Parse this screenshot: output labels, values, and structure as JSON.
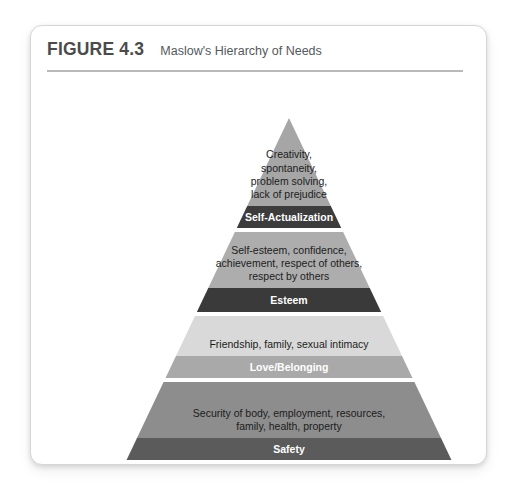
{
  "figure": {
    "number": "FIGURE 4.3",
    "title": "Maslow's Hierarchy of Needs"
  },
  "chart_data": {
    "type": "pyramid",
    "title": "Maslow's Hierarchy of Needs",
    "orientation": "apex-top",
    "level_count": 5,
    "levels": [
      {
        "rank": 5,
        "label": "Self-Actualization",
        "description": "Creativity, spontaneity, problem solving, lack of prejudice",
        "description_lines": [
          "Creativity,",
          "spontaneity,",
          "problem solving,",
          "lack of prejudice"
        ],
        "body_color": "#a6a6a6",
        "band_color": "#3c3c3c"
      },
      {
        "rank": 4,
        "label": "Esteem",
        "description": "Self-esteem, confidence, achievement, respect of others, respect by others",
        "description_lines": [
          "Self-esteem, confidence,",
          "achievement, respect of others,",
          "respect by others"
        ],
        "body_color": "#adadad",
        "band_color": "#3a3a3a"
      },
      {
        "rank": 3,
        "label": "Love/Belonging",
        "description": "Friendship, family, sexual intimacy",
        "description_lines": [
          "Friendship, family, sexual intimacy"
        ],
        "body_color": "#d9d9d9",
        "band_color": "#a9a9a9"
      },
      {
        "rank": 2,
        "label": "Safety",
        "description": "Security of body, employment, resources, family, health, property",
        "description_lines": [
          "Security of body, employment, resources,",
          "family, health, property"
        ],
        "body_color": "#8d8d8d",
        "band_color": "#5b5b5b"
      },
      {
        "rank": 1,
        "label": "Physiological",
        "description": "Breathing, food, water, sleep",
        "description_lines": [
          "Breathing, food, water, sleep"
        ],
        "body_color": "#6f6f6f",
        "band_color": "#474747"
      }
    ]
  }
}
